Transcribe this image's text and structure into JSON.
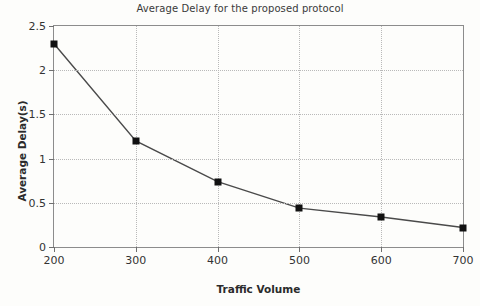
{
  "chart_data": {
    "type": "line",
    "title": "Average Delay for the proposed protocol",
    "xlabel": "Traffic Volume",
    "ylabel": "Average Delay(s)",
    "x": [
      200,
      300,
      400,
      500,
      600,
      700
    ],
    "values": [
      2.3,
      1.2,
      0.74,
      0.44,
      0.34,
      0.22
    ],
    "xtick_labels": [
      "200",
      "300",
      "400",
      "500",
      "600",
      "700"
    ],
    "ytick_labels": [
      "0",
      "0.5",
      "1",
      "1.5",
      "2",
      "2.5"
    ],
    "yticks": [
      0,
      0.5,
      1,
      1.5,
      2,
      2.5
    ],
    "xlim": [
      200,
      700
    ],
    "ylim": [
      0,
      2.5
    ],
    "grid": true,
    "legend": null,
    "marker": "square",
    "line_color": "#4a4a4a",
    "marker_color": "#111111",
    "grid_color": "#b9b9b9",
    "axis_color": "#8c8c8c",
    "background_color": "#fdfdfb"
  }
}
